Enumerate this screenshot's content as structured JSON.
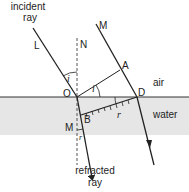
{
  "diagram": {
    "colors": {
      "water": "#e6e6e6",
      "line": "#222222",
      "background": "#ffffff"
    },
    "labels": {
      "incident_ray": [
        "incident",
        "ray"
      ],
      "refracted_ray": [
        "refracted",
        "ray"
      ],
      "L": "L",
      "N": "N",
      "M_top": "M",
      "A": "A",
      "O": "O",
      "D": "D",
      "B": "B",
      "M_bottom": "M",
      "air": "air",
      "water": "water",
      "angle_i_1": "i",
      "angle_i_2": "i",
      "angle_r_1": "r",
      "angle_r_2": "r"
    }
  }
}
